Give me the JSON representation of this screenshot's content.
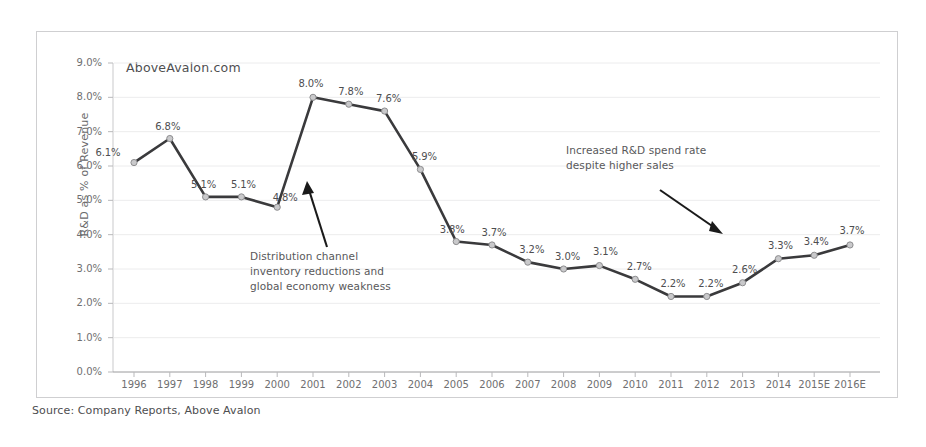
{
  "chart_data": {
    "type": "line",
    "title": "",
    "subtitle": "",
    "xlabel": "",
    "ylabel": "R&D as % of Revenue",
    "ylim": [
      0,
      9
    ],
    "ytick_labels": [
      "0.0%",
      "1.0%",
      "2.0%",
      "3.0%",
      "4.0%",
      "5.0%",
      "6.0%",
      "7.0%",
      "8.0%",
      "9.0%"
    ],
    "ytick_values": [
      0,
      1,
      2,
      3,
      4,
      5,
      6,
      7,
      8,
      9
    ],
    "grid": true,
    "legend": null,
    "categories": [
      "1996",
      "1997",
      "1998",
      "1999",
      "2000",
      "2001",
      "2002",
      "2003",
      "2004",
      "2005",
      "2006",
      "2007",
      "2008",
      "2009",
      "2010",
      "2011",
      "2012",
      "2013",
      "2014",
      "2015E",
      "2016E"
    ],
    "values": [
      6.1,
      6.8,
      5.1,
      5.1,
      4.8,
      8.0,
      7.8,
      7.6,
      5.9,
      3.8,
      3.7,
      3.2,
      3.0,
      3.1,
      2.7,
      2.2,
      2.2,
      2.6,
      3.3,
      3.4,
      3.7
    ],
    "data_labels": [
      "6.1%",
      "6.8%",
      "5.1%",
      "5.1%",
      "4.8%",
      "8.0%",
      "7.8%",
      "7.6%",
      "5.9%",
      "3.8%",
      "3.7%",
      "3.2%",
      "3.0%",
      "3.1%",
      "2.7%",
      "2.2%",
      "2.2%",
      "2.6%",
      "3.3%",
      "3.4%",
      "3.7%"
    ],
    "series_color": "#3a3a3c",
    "marker_color": "#c9c9cb",
    "annotations": [
      {
        "name": "distribution-channel-note",
        "text": "Distribution channel\ninventory reductions and\nglobal economy weakness"
      },
      {
        "name": "increased-rd-spend-note",
        "text": "Increased R&D spend rate\ndespite higher sales"
      }
    ],
    "watermark": "AboveAvalon.com"
  },
  "footer": {
    "source": "Source: Company Reports, Above Avalon"
  }
}
